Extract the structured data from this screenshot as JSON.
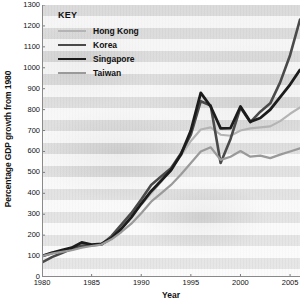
{
  "chart_data": {
    "type": "line",
    "title": "",
    "xlabel": "Year",
    "ylabel": "Percentage GDP growth from 1980",
    "xlim": [
      1980,
      2006
    ],
    "ylim": [
      0,
      1300
    ],
    "grid": true,
    "legend_position": "top-left",
    "legend_title": "KEY",
    "x_ticks": [
      1980,
      1985,
      1990,
      1995,
      2000,
      2005
    ],
    "y_ticks": [
      0,
      100,
      200,
      300,
      400,
      500,
      600,
      700,
      800,
      900,
      1000,
      1100,
      1200,
      1300
    ],
    "x": [
      1980,
      1981,
      1982,
      1983,
      1984,
      1985,
      1986,
      1987,
      1988,
      1989,
      1990,
      1991,
      1992,
      1993,
      1994,
      1995,
      1996,
      1997,
      1998,
      1999,
      2000,
      2001,
      2002,
      2003,
      2004,
      2005,
      2006
    ],
    "series": [
      {
        "name": "Hong Kong",
        "color": "#b4b4b4",
        "width": 2.2,
        "values": [
          100,
          118,
          125,
          130,
          142,
          152,
          160,
          190,
          235,
          290,
          345,
          400,
          455,
          520,
          580,
          650,
          705,
          715,
          680,
          675,
          700,
          710,
          715,
          720,
          745,
          780,
          810
        ]
      },
      {
        "name": "Korea",
        "color": "#4a4a4a",
        "width": 2.6,
        "values": [
          70,
          95,
          115,
          135,
          150,
          152,
          155,
          195,
          250,
          305,
          370,
          440,
          480,
          520,
          590,
          680,
          840,
          820,
          545,
          660,
          810,
          740,
          790,
          830,
          930,
          1060,
          1230
        ]
      },
      {
        "name": "Singapore",
        "color": "#1c1c1c",
        "width": 2.8,
        "values": [
          100,
          115,
          128,
          140,
          165,
          155,
          158,
          185,
          230,
          285,
          350,
          410,
          460,
          510,
          585,
          700,
          880,
          815,
          710,
          712,
          815,
          742,
          760,
          800,
          860,
          920,
          990
        ]
      },
      {
        "name": "Taiwan",
        "color": "#9a9a9a",
        "width": 2.2,
        "values": [
          100,
          112,
          120,
          128,
          140,
          148,
          155,
          180,
          215,
          255,
          305,
          360,
          400,
          440,
          490,
          545,
          600,
          620,
          560,
          575,
          602,
          575,
          580,
          568,
          585,
          600,
          615
        ]
      }
    ]
  },
  "legend": {
    "title": "KEY",
    "items": [
      {
        "label": "Hong Kong"
      },
      {
        "label": "Korea"
      },
      {
        "label": "Singapore"
      },
      {
        "label": "Taiwan"
      }
    ]
  },
  "axes": {
    "x_title": "Year",
    "y_title": "Percentage GDP growth from 1980"
  }
}
